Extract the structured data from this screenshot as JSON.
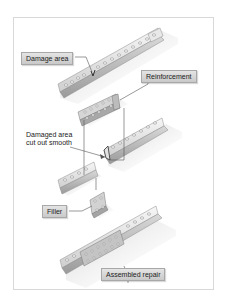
{
  "diagram": {
    "labels": {
      "damage_area": "Damage area",
      "reinforcement": "Reinforcement",
      "damaged_area_cut_line1": "Damaged area",
      "damaged_area_cut_line2": "cut out smooth",
      "filler": "Filler",
      "assembled_repair": "Assembled repair"
    },
    "colors": {
      "label_box": "#d4d4d4",
      "metal_light": "#efefef",
      "metal_mid": "#c8c8c8",
      "metal_dark": "#8a8a8a",
      "frame_border": "#d8d8d8",
      "leader_line": "#555555"
    }
  }
}
